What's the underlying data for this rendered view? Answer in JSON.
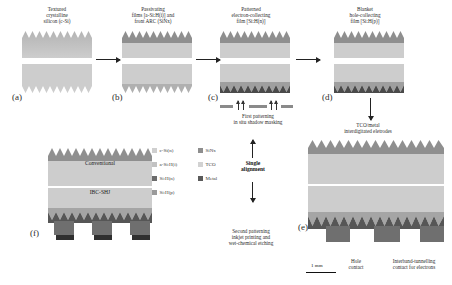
{
  "figure": {
    "scale_bar": "1 mm"
  },
  "panels": [
    {
      "id": "a",
      "label": "(a)",
      "caption": "Textured\ncrystalline\nsilicon (c-Si)"
    },
    {
      "id": "b",
      "label": "(b)",
      "caption": "Passivating\nfilms [a-Si:H(i)] and\nfront ARC (SiNx)"
    },
    {
      "id": "c",
      "label": "(c)",
      "caption": "Patterned\nelectron-collecting\nfilm [Si:H(n)]"
    },
    {
      "id": "d",
      "label": "(d)",
      "caption": "Blanket\nhole-collecting\nfilm [Si:H(p)]"
    },
    {
      "id": "e",
      "label": "(e)",
      "caption": "TCO/metal\ninterdigitated eletrodes"
    },
    {
      "id": "f",
      "label": "(f)",
      "caption": ""
    }
  ],
  "captions": {
    "a_line1": "Textured",
    "a_line2": "crystalline",
    "a_line3": "silicon (c-Si)",
    "b_line1": "Passivating",
    "b_line2": "films [a-Si:H(i)] and",
    "b_line3": "front ARC (SiNx)",
    "c_line1": "Patterned",
    "c_line2": "electron-collecting",
    "c_line3": "film [Si:H(n)]",
    "d_line1": "Blanket",
    "d_line2": "hole-collecting",
    "d_line3": "film [Si:H(p)]",
    "e_line1": "TCO/metal",
    "e_line2": "interdigitated eletrodes"
  },
  "process_notes": {
    "first_patterning_l1": "First patterning",
    "first_patterning_l2": "in situ shadow masking",
    "second_patterning_l1": "Second patterning",
    "second_patterning_l2": "inkjet printing and",
    "second_patterning_l3": "wet-chemical etching",
    "single_alignment_l1": "Single",
    "single_alignment_l2": "alignment"
  },
  "inline_labels": {
    "conventional": "Conventional",
    "ibc_shj": "IBC-SHJ",
    "tunnel_ibc": "Tunnel-IBC",
    "hole_contact_l1": "Hole",
    "hole_contact_l2": "contact",
    "tunnel_contact_l1": "Interband-tunnelling",
    "tunnel_contact_l2": "contact for electrons"
  },
  "legend": {
    "column1": [
      {
        "label": "c-Si(n)",
        "color": "#cfcfcf"
      },
      {
        "label": "a-Si:H(i)",
        "color": "#c2c2c2"
      },
      {
        "label": "Si:H(n)",
        "color": "#6b6b6b"
      },
      {
        "label": "Si:H(p)",
        "color": "#9a9a9a"
      }
    ],
    "column2": [
      {
        "label": "SiNx",
        "color": "#8e8e8e"
      },
      {
        "label": "TCO",
        "color": "#d2d2d2"
      },
      {
        "label": "Metal",
        "color": "#5a5a5a"
      }
    ]
  },
  "colors": {
    "wafer": "#c9c9c9",
    "dark_layer": "#5f5f5f",
    "mid_layer": "#9a9a9a",
    "metal": "#3b3b3b",
    "background": "#ffffff"
  }
}
